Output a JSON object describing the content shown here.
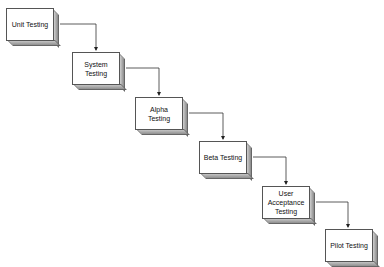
{
  "diagram": {
    "type": "waterfall flow",
    "stages": [
      {
        "label": "Unit Testing",
        "x": 6,
        "y": 8
      },
      {
        "label": "System Testing",
        "x": 72,
        "y": 52
      },
      {
        "label": "Alpha Testing",
        "x": 135,
        "y": 97
      },
      {
        "label": "Beta Testing",
        "x": 199,
        "y": 141
      },
      {
        "label": "User Acceptance Testing",
        "x": 262,
        "y": 186
      },
      {
        "label": "Pilot Testing",
        "x": 325,
        "y": 229
      }
    ],
    "connectors": [
      {
        "from": "Unit Testing",
        "to": "System Testing"
      },
      {
        "from": "System Testing",
        "to": "Alpha Testing"
      },
      {
        "from": "Alpha Testing",
        "to": "Beta Testing"
      },
      {
        "from": "Beta Testing",
        "to": "User Acceptance Testing"
      },
      {
        "from": "User Acceptance Testing",
        "to": "Pilot Testing"
      }
    ]
  }
}
